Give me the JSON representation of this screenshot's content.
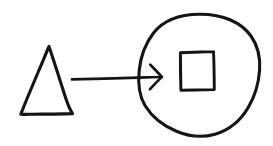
{
  "canvas": {
    "width": 273,
    "height": 146,
    "background_color": "#ffffff",
    "ink_color": "#151515",
    "style": "hand-drawn sketch",
    "title": "Hand-drawn shape diagram"
  },
  "diagram": {
    "kind": "sketch-diagram",
    "shapes": [
      {
        "id": "triangle",
        "name": "triangle",
        "label": "",
        "role": "source-node",
        "stroke_color": "#151515",
        "fill": "none",
        "points": "49,47 73,114 21,114",
        "bbox": {
          "x": 21,
          "y": 46,
          "width": 52,
          "height": 69
        }
      },
      {
        "id": "circle",
        "name": "circle",
        "label": "",
        "role": "target-node",
        "stroke_color": "#151515",
        "fill": "none",
        "center": {
          "cx": 199,
          "cy": 75
        },
        "radius": {
          "rx": 60,
          "ry": 61
        },
        "bbox": {
          "x": 139,
          "y": 14,
          "width": 120,
          "height": 122
        }
      },
      {
        "id": "square",
        "name": "square",
        "label": "",
        "role": "inner-node",
        "contained_in": "circle",
        "stroke_color": "#151515",
        "fill": "none",
        "bbox": {
          "x": 180,
          "y": 52,
          "width": 34,
          "height": 38
        }
      }
    ],
    "connectors": [
      {
        "id": "arrow",
        "name": "arrow",
        "label": "",
        "from": "triangle",
        "to": "circle",
        "direction": "right",
        "head": "single",
        "stroke_color": "#151515",
        "start": {
          "x": 72,
          "y": 79
        },
        "end": {
          "x": 162,
          "y": 77
        },
        "head_points": {
          "upper": {
            "x": 150,
            "y": 65
          },
          "tip": {
            "x": 162,
            "y": 77
          },
          "lower": {
            "x": 150,
            "y": 89
          }
        }
      }
    ]
  },
  "paths": {
    "triangle_d": "M 49.0 46.5 C 53.0 58.0 60.5 82.0 66.0 99.0 C 68.8 107.2 70.8 111.2 72.6 113.6 M 72.6 113.6 C 63.0 113.9 43.0 114.1 30.0 114.3 C 25.5 114.4 22.6 114.4 20.8 114.1 M 20.8 114.1 C 23.6 107.0 31.0 89.0 38.0 72.5 C 43.5 59.7 47.0 51.0 49.0 46.5",
    "circle_d": "M 199.5 14.2 C 223.0 14.0 241.5 22.5 251.0 36.0 C 258.5 46.8 260.5 58.0 259.6 70.0 C 258.8 82.0 255.5 95.0 248.5 107.0 C 241.0 120.0 229.5 130.0 215.0 134.2 C 202.5 137.8 189.0 136.4 177.0 131.5 C 163.5 126.0 152.0 117.0 145.0 105.5 C 138.8 95.2 137.9 83.0 139.2 70.5 C 140.5 57.5 145.0 44.0 153.5 33.0 C 163.0 20.6 178.5 14.4 199.5 14.2 Z",
    "square_d": "M 180.4 52.8 C 189.0 52.4 203.0 52.0 213.5 51.6 M 213.5 51.6 C 213.9 59.5 214.2 76.5 214.3 89.6 M 214.3 89.6 C 205.5 89.8 191.0 90.1 180.9 90.2 M 180.9 90.2 C 180.6 81.0 180.3 63.5 180.4 52.8 Z",
    "arrow_line_d": "M 72.0 79.4 C 95.0 78.8 128.0 78.0 147.0 77.4 C 154.5 77.1 159.0 77.0 161.8 77.0",
    "arrow_head_upper_d": "M 150.2 64.6 C 153.5 68.0 158.0 72.5 161.8 76.9",
    "arrow_head_lower_d": "M 161.8 76.9 C 158.5 80.2 153.8 85.0 150.0 89.2"
  }
}
